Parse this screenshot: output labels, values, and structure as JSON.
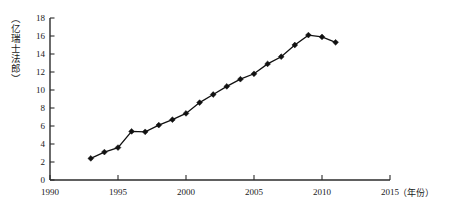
{
  "chart_data": {
    "type": "line",
    "title": "",
    "subtitle": "",
    "xlabel": "（年份）",
    "ylabel": "（亿瑞士法郎）",
    "xlim": [
      1990,
      2015
    ],
    "ylim": [
      0,
      18
    ],
    "grid": false,
    "legend": null,
    "x_ticks": [
      "1990",
      "1995",
      "2000",
      "2005",
      "2010",
      "2015"
    ],
    "x_tick_values": [
      1990,
      1995,
      2000,
      2005,
      2010,
      2015
    ],
    "y_ticks": [
      "0",
      "2",
      "4",
      "6",
      "8",
      "10",
      "12",
      "14",
      "16",
      "18"
    ],
    "y_tick_values": [
      0,
      2,
      4,
      6,
      8,
      10,
      12,
      14,
      16,
      18
    ],
    "x": [
      1993,
      1994,
      1995,
      1996,
      1997,
      1998,
      1999,
      2000,
      2001,
      2002,
      2003,
      2004,
      2005,
      2006,
      2007,
      2008,
      2009,
      2010,
      2011
    ],
    "values": [
      2.4,
      3.1,
      3.6,
      5.4,
      5.35,
      6.1,
      6.7,
      7.4,
      8.6,
      9.5,
      10.4,
      11.2,
      11.8,
      12.9,
      13.7,
      15.0,
      16.1,
      15.9,
      15.3
    ],
    "series": [
      {
        "name": "",
        "marker": "diamond",
        "color": "#111111",
        "x": [
          1993,
          1994,
          1995,
          1996,
          1997,
          1998,
          1999,
          2000,
          2001,
          2002,
          2003,
          2004,
          2005,
          2006,
          2007,
          2008,
          2009,
          2010,
          2011
        ],
        "values": [
          2.4,
          3.1,
          3.6,
          5.4,
          5.35,
          6.1,
          6.7,
          7.4,
          8.6,
          9.5,
          10.4,
          11.2,
          11.8,
          12.9,
          13.7,
          15.0,
          16.1,
          15.9,
          15.3
        ]
      }
    ]
  },
  "axes": {
    "y_unit_label": "（亿瑞士法郎）",
    "x_unit_label": "（年份）"
  },
  "colors": {
    "line": "#111111",
    "axis": "#2b2b2b",
    "background": "#ffffff",
    "text": "#1a1a1a"
  }
}
